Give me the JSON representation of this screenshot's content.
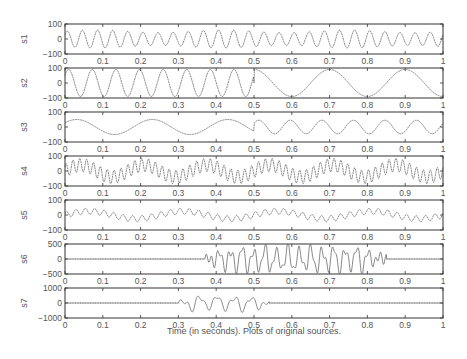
{
  "chart_data": {
    "type": "line",
    "title": "",
    "xlabel": "Time (in seconds). Plots of original sources.",
    "x_range": [
      0,
      1
    ],
    "x_ticks": [
      "0",
      "0.1",
      "0.2",
      "0.3",
      "0.4",
      "0.5",
      "0.6",
      "0.7",
      "0.8",
      "0.9",
      "1"
    ],
    "grid": false,
    "legend": null,
    "panels": [
      {
        "name": "s1",
        "ylim": [
          -100,
          100
        ],
        "y_ticks": [
          "100",
          "0",
          "-100"
        ],
        "description": "sinusoid ~25 Hz with slight amplitude/frequency modulation, amplitude ~60",
        "segments": [
          {
            "t0": 0,
            "t1": 1,
            "freq": 25,
            "amp": 60
          }
        ]
      },
      {
        "name": "s2",
        "ylim": [
          -100,
          100
        ],
        "y_ticks": [
          "100",
          "0",
          "-100"
        ],
        "description": "sinusoid ~16 Hz until 0.5 s, then ~5 Hz, amplitude ~90",
        "segments": [
          {
            "t0": 0,
            "t1": 0.5,
            "freq": 16,
            "amp": 90
          },
          {
            "t0": 0.5,
            "t1": 1,
            "freq": 5,
            "amp": 90
          }
        ]
      },
      {
        "name": "s3",
        "ylim": [
          -100,
          100
        ],
        "y_ticks": [
          "100",
          "0",
          "-100"
        ],
        "description": "sinusoid ~5 Hz until 0.5 s, then ~12 Hz, amplitude ~50",
        "segments": [
          {
            "t0": 0,
            "t1": 0.5,
            "freq": 5,
            "amp": 50
          },
          {
            "t0": 0.5,
            "t1": 1,
            "freq": 12,
            "amp": 45
          }
        ]
      },
      {
        "name": "s4",
        "ylim": [
          -100,
          100
        ],
        "y_ticks": [
          "100",
          "0",
          "-100"
        ],
        "description": "sum of ~55 Hz and ~6 Hz components, peaks near +/-90",
        "segments": [
          {
            "t0": 0,
            "t1": 1,
            "freq": 55,
            "amp": 45,
            "freq2": 6,
            "amp2": 40
          }
        ]
      },
      {
        "name": "s5",
        "ylim": [
          -100,
          100
        ],
        "y_ticks": [
          "100",
          "0",
          "-100"
        ],
        "description": "~40 Hz ripple on slow ~4 Hz wave, amplitude ~40",
        "segments": [
          {
            "t0": 0,
            "t1": 1,
            "freq": 40,
            "amp": 20,
            "freq2": 4,
            "amp2": 25
          }
        ]
      },
      {
        "name": "s6",
        "ylim": [
          -500,
          500
        ],
        "y_ticks": [
          "500",
          "0",
          "-500"
        ],
        "description": "zero (dotted) until ~0.37 s, burst ~33 Hz amplitude ~450 until ~0.85 s, then zero",
        "segments": [
          {
            "t0": 0.37,
            "t1": 0.85,
            "freq": 33,
            "amp": 430
          }
        ]
      },
      {
        "name": "s7",
        "ylim": [
          -1000,
          1000
        ],
        "y_ticks": [
          "1000",
          "0",
          "-1000"
        ],
        "description": "zero (dotted) until ~0.3 s, burst ~22 Hz amplitude ~500 until ~0.54 s, then zero",
        "segments": [
          {
            "t0": 0.3,
            "t1": 0.54,
            "freq": 22,
            "amp": 480
          }
        ]
      }
    ]
  }
}
